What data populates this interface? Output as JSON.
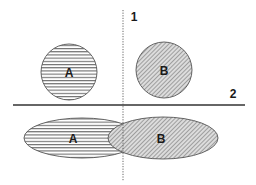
{
  "diagram": {
    "divider_labels": {
      "vertical": "1",
      "horizontal": "2"
    },
    "top_row": {
      "circle_a": {
        "label": "A",
        "fill_pattern": "horizontal-stripes"
      },
      "circle_b": {
        "label": "B",
        "fill_pattern": "diagonal-hatch"
      }
    },
    "bottom_row": {
      "ellipse_a": {
        "label": "A",
        "fill_pattern": "horizontal-stripes"
      },
      "ellipse_b": {
        "label": "B",
        "fill_pattern": "diagonal-hatch"
      }
    },
    "colors": {
      "stroke": "#555555",
      "stripe": "#444444",
      "hatch_bg": "#d6d6d6",
      "hatch_line": "#666666",
      "divider": "#333333"
    }
  }
}
